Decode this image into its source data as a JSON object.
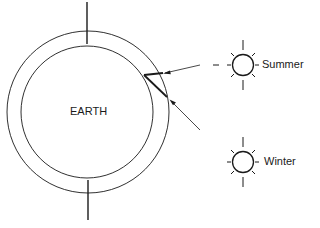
{
  "diagram": {
    "earth_label": "EARTH",
    "suns": [
      {
        "label": "Summer",
        "icon": "sun-icon"
      },
      {
        "label": "Winter",
        "icon": "sun-icon"
      }
    ],
    "colors": {
      "stroke": "#1a1a1a",
      "background": "#ffffff"
    }
  }
}
